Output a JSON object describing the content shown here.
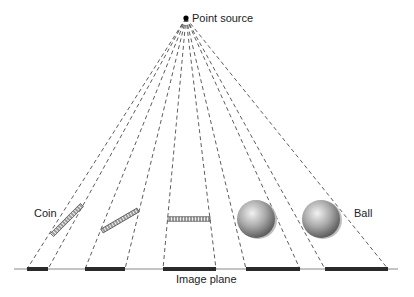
{
  "labels": {
    "point_source": "Point source",
    "coin": "Coin",
    "ball": "Ball",
    "image_plane": "Image plane"
  },
  "colors": {
    "line": "#333333",
    "plane": "#888888",
    "shadow": "#2a2a2a",
    "ball_light": "#e6e6e6",
    "ball_dark": "#6f6f6f"
  },
  "source": {
    "x": 186,
    "y": 18
  },
  "image_plane": {
    "y": 269,
    "x1": 14,
    "x2": 398
  },
  "shadows": [
    {
      "x1": 27,
      "x2": 48
    },
    {
      "x1": 85,
      "x2": 125
    },
    {
      "x1": 163,
      "x2": 216
    },
    {
      "x1": 246,
      "x2": 300
    },
    {
      "x1": 325,
      "x2": 388
    }
  ],
  "objects": [
    {
      "type": "coin",
      "x1": 52,
      "y1": 235,
      "x2": 82,
      "y2": 205
    },
    {
      "type": "coin",
      "x1": 102,
      "y1": 231,
      "x2": 138,
      "y2": 210
    },
    {
      "type": "coin",
      "x1": 168,
      "y1": 219,
      "x2": 210,
      "y2": 219
    },
    {
      "type": "ball",
      "cx": 256,
      "cy": 219,
      "r": 19
    },
    {
      "type": "ball",
      "cx": 321,
      "cy": 219,
      "r": 19
    }
  ]
}
